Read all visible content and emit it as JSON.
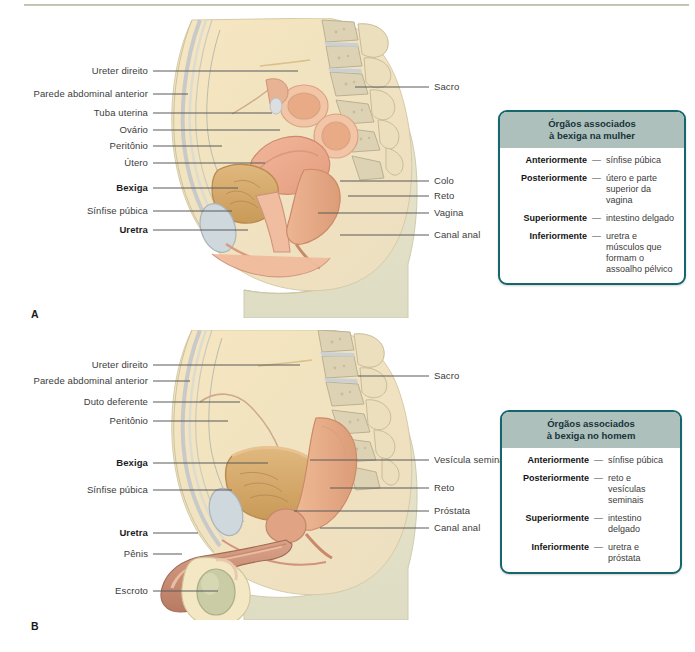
{
  "figure": {
    "panels": [
      {
        "letter": "A",
        "subject": "female",
        "left_labels": [
          {
            "text": "Ureter direito",
            "bold": false,
            "y": 71,
            "tip_x": 298
          },
          {
            "text": "Parede abdominal anterior",
            "bold": false,
            "y": 94,
            "tip_x": 188
          },
          {
            "text": "Tuba uterina",
            "bold": false,
            "y": 113,
            "tip_x": 272
          },
          {
            "text": "Ovário",
            "bold": false,
            "y": 130,
            "tip_x": 280
          },
          {
            "text": "Peritônio",
            "bold": false,
            "y": 146,
            "tip_x": 222
          },
          {
            "text": "Útero",
            "bold": false,
            "y": 163,
            "tip_x": 265
          },
          {
            "text": "Bexiga",
            "bold": true,
            "y": 188,
            "tip_x": 238
          },
          {
            "text": "Sínfise púbica",
            "bold": false,
            "y": 211,
            "tip_x": 232
          },
          {
            "text": "Uretra",
            "bold": true,
            "y": 230,
            "tip_x": 248
          }
        ],
        "right_labels": [
          {
            "text": "Sacro",
            "bold": false,
            "y": 87,
            "tip_x": 355
          },
          {
            "text": "Colo",
            "bold": false,
            "y": 181,
            "tip_x": 340
          },
          {
            "text": "Reto",
            "bold": false,
            "y": 196,
            "tip_x": 348
          },
          {
            "text": "Vagina",
            "bold": false,
            "y": 213,
            "tip_x": 318
          },
          {
            "text": "Canal anal",
            "bold": false,
            "y": 235,
            "tip_x": 340
          }
        ],
        "infobox": {
          "title_line1": "Órgãos associados",
          "title_line2": "à bexiga na mulher",
          "rows": [
            {
              "term": "Anteriormente",
              "dash": "—",
              "def": "sínfise púbica"
            },
            {
              "term": "Posteriormente",
              "dash": "—",
              "def": "útero e parte superior da vagina"
            },
            {
              "term": "Superiormente",
              "dash": "—",
              "def": "intestino delgado"
            },
            {
              "term": "Inferiormente",
              "dash": "—",
              "def": "uretra e músculos que formam o assoalho pélvico"
            }
          ]
        }
      },
      {
        "letter": "B",
        "subject": "male",
        "left_labels": [
          {
            "text": "Ureter direito",
            "bold": false,
            "y": 365,
            "tip_x": 300
          },
          {
            "text": "Parede abdominal anterior",
            "bold": false,
            "y": 381,
            "tip_x": 190
          },
          {
            "text": "Duto deferente",
            "bold": false,
            "y": 402,
            "tip_x": 240
          },
          {
            "text": "Peritônio",
            "bold": false,
            "y": 421,
            "tip_x": 228
          },
          {
            "text": "Bexiga",
            "bold": true,
            "y": 463,
            "tip_x": 268
          },
          {
            "text": "Sínfise púbica",
            "bold": false,
            "y": 490,
            "tip_x": 232
          },
          {
            "text": "Uretra",
            "bold": true,
            "y": 533,
            "tip_x": 198
          },
          {
            "text": "Pênis",
            "bold": false,
            "y": 554,
            "tip_x": 182
          },
          {
            "text": "Escroto",
            "bold": false,
            "y": 591,
            "tip_x": 218
          }
        ],
        "right_labels": [
          {
            "text": "Sacro",
            "bold": false,
            "y": 376,
            "tip_x": 358
          },
          {
            "text": "Vesícula seminal",
            "bold": false,
            "y": 460,
            "tip_x": 310
          },
          {
            "text": "Reto",
            "bold": false,
            "y": 488,
            "tip_x": 330
          },
          {
            "text": "Próstata",
            "bold": false,
            "y": 511,
            "tip_x": 294
          },
          {
            "text": "Canal anal",
            "bold": false,
            "y": 528,
            "tip_x": 320
          }
        ],
        "infobox": {
          "title_line1": "Órgãos associados",
          "title_line2": "à bexiga no homem",
          "rows": [
            {
              "term": "Anteriormente",
              "dash": "—",
              "def": "sínfise púbica"
            },
            {
              "term": "Posteriormente",
              "dash": "—",
              "def": "reto e vesículas seminais"
            },
            {
              "term": "Superiormente",
              "dash": "—",
              "def": "intestino delgado"
            },
            {
              "term": "Inferiormente",
              "dash": "—",
              "def": "uretra e próstata"
            }
          ]
        }
      }
    ]
  },
  "colors": {
    "rule": "#aeb49c",
    "box_border": "#16666e",
    "box_header_bg": "#aec0bb",
    "skin": "#f6e3bb",
    "skin_shadow": "#e6dcc0",
    "fat": "#f7e7bd",
    "muscle": "#e8a98b",
    "bladder": "#d9a86a",
    "bone": "#d8cdae",
    "cartilage": "#c3cdd2",
    "leader": "#5a5a5a"
  }
}
